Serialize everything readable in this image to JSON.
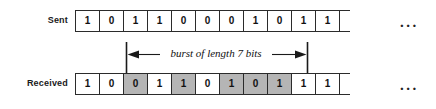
{
  "figure": {
    "rows": [
      {
        "key": "sent",
        "label": "Sent",
        "bits": [
          "1",
          "0",
          "1",
          "1",
          "0",
          "0",
          "0",
          "1",
          "0",
          "1",
          "1"
        ],
        "shaded": [
          false,
          false,
          false,
          false,
          false,
          false,
          false,
          false,
          false,
          false,
          false
        ],
        "trailing": "..."
      },
      {
        "key": "received",
        "label": "Received",
        "bits": [
          "1",
          "0",
          "0",
          "1",
          "1",
          "0",
          "1",
          "0",
          "1",
          "1",
          "1"
        ],
        "shaded": [
          false,
          false,
          true,
          false,
          true,
          false,
          true,
          true,
          true,
          false,
          false
        ],
        "trailing": "..."
      }
    ],
    "annotation": {
      "label": "burst of length 7 bits",
      "start_bit_index": 3,
      "end_bit_index": 9,
      "length": 7,
      "unit": "bits"
    },
    "colors": {
      "shaded_cell": "#b5b5b5",
      "cell_border": "#2b2b2b",
      "text": "#111111",
      "background": "#ffffff"
    }
  }
}
